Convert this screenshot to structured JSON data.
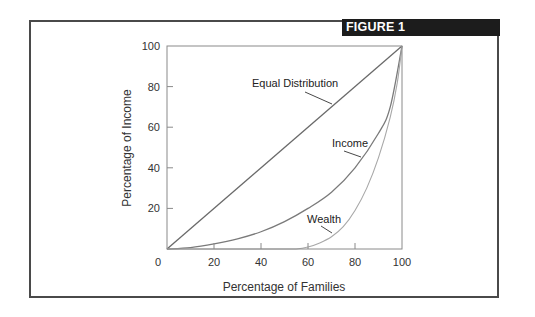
{
  "figure": {
    "label": "FIGURE 1"
  },
  "colors": {
    "frame": "#4a4a4a",
    "banner_bg": "#1c1c1c",
    "banner_text": "#ffffff",
    "equal_line": "#6a6a6a",
    "income_line": "#7a7a7a",
    "wealth_line": "#a8a8a8",
    "axis": "#8a8a8a"
  },
  "chart_data": {
    "type": "line",
    "title": "FIGURE 1",
    "xlabel": "Percentage of Families",
    "ylabel": "Percentage of Income",
    "xlim": [
      0,
      100
    ],
    "ylim": [
      0,
      100
    ],
    "x_ticks": [
      "0",
      "20",
      "40",
      "60",
      "80",
      "100"
    ],
    "y_ticks": [
      "20",
      "40",
      "60",
      "80",
      "100"
    ],
    "grid": false,
    "legend": "inline annotations",
    "series": [
      {
        "name": "Equal Distribution",
        "x": [
          0,
          100
        ],
        "y": [
          0,
          100
        ]
      },
      {
        "name": "Income",
        "x": [
          0,
          10,
          20,
          30,
          40,
          50,
          60,
          70,
          80,
          90,
          95,
          100
        ],
        "y": [
          0,
          0.7,
          2.5,
          5,
          8.5,
          13.5,
          20,
          28,
          40,
          57,
          70,
          100
        ]
      },
      {
        "name": "Wealth",
        "x": [
          0,
          50,
          55,
          60,
          65,
          70,
          75,
          80,
          85,
          90,
          95,
          98,
          100
        ],
        "y": [
          0,
          0,
          0,
          1,
          3,
          6,
          11,
          19,
          30,
          45,
          65,
          82,
          100
        ]
      }
    ],
    "annotations": [
      {
        "text": "Equal Distribution",
        "points_to": "Equal Distribution"
      },
      {
        "text": "Income",
        "points_to": "Income"
      },
      {
        "text": "Wealth",
        "points_to": "Wealth"
      }
    ]
  }
}
